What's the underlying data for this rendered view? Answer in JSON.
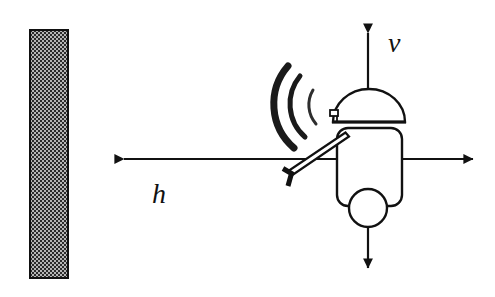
{
  "figure": {
    "background_color": "#ffffff",
    "ink_color": "#111111",
    "width": 495,
    "height": 297
  },
  "labels": {
    "vertical_axis": "v",
    "horizontal_axis": "h"
  },
  "wall": {
    "name": "wall",
    "fill_pattern": "checkerboard-hatch",
    "pattern_dark": "#2b2b2b",
    "pattern_light": "#b5b5b5",
    "border_color": "#111111",
    "x": 30,
    "y": 30,
    "width": 38,
    "height": 248
  },
  "axes": {
    "horizontal": {
      "name": "h-axis",
      "y": 159,
      "x_start": 119,
      "x_end": 478,
      "arrow_left": true,
      "arrow_right": true
    },
    "vertical": {
      "name": "v-axis",
      "x": 368,
      "y_start": 28,
      "y_end": 273,
      "arrow_up": true,
      "arrow_down": true
    }
  },
  "robot": {
    "name": "mobile-robot",
    "dome": {
      "center_x": 369,
      "base_y": 122,
      "radius_x": 36,
      "radius_y": 33
    },
    "dome_base_bar": {
      "x1": 333,
      "x2": 405,
      "y": 122
    },
    "dome_knob": {
      "x": 331,
      "y": 112,
      "width": 7,
      "height": 6
    },
    "body": {
      "x": 337,
      "y": 128,
      "width": 65,
      "height": 78,
      "corner_radius": 11
    },
    "wheel": {
      "center_x": 368,
      "center_y": 208,
      "radius": 19
    },
    "sensor_arm": {
      "x1": 344,
      "y1": 135,
      "x2": 289,
      "y2": 172,
      "thickness": 5
    },
    "sensor_hook": {
      "x": 285,
      "y": 170,
      "width": 11,
      "height": 16
    }
  },
  "sonar_waves": {
    "name": "sonar-waves",
    "origin_x": 338,
    "origin_y": 104,
    "arcs": [
      {
        "radius": 56,
        "stroke_width": 7.0,
        "color": "#1a1a1a",
        "sweep_deg": 62
      },
      {
        "radius": 41,
        "stroke_width": 5.0,
        "color": "#1a1a1a",
        "sweep_deg": 56
      },
      {
        "radius": 27,
        "stroke_width": 3.0,
        "color": "#2e2e2e",
        "sweep_deg": 42
      }
    ]
  }
}
